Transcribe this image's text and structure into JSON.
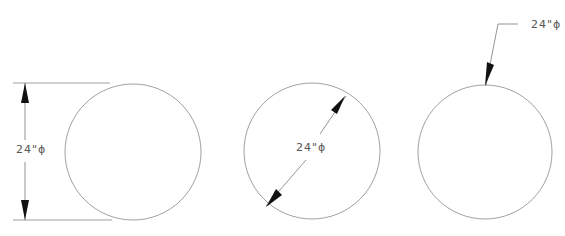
{
  "diagram": {
    "colors": {
      "line": "#888888",
      "arrow": "#111111",
      "text": "#555555"
    },
    "figures": [
      {
        "id": "linear-dimension",
        "label": "24\"ϕ",
        "style": "vertical dimension with extension lines"
      },
      {
        "id": "diameter-dimension",
        "label": "24\"ϕ",
        "style": "diagonal diameter dimension inside circle"
      },
      {
        "id": "leader-dimension",
        "label": "24\"ϕ",
        "style": "leader arrow pointing to circle"
      }
    ]
  }
}
